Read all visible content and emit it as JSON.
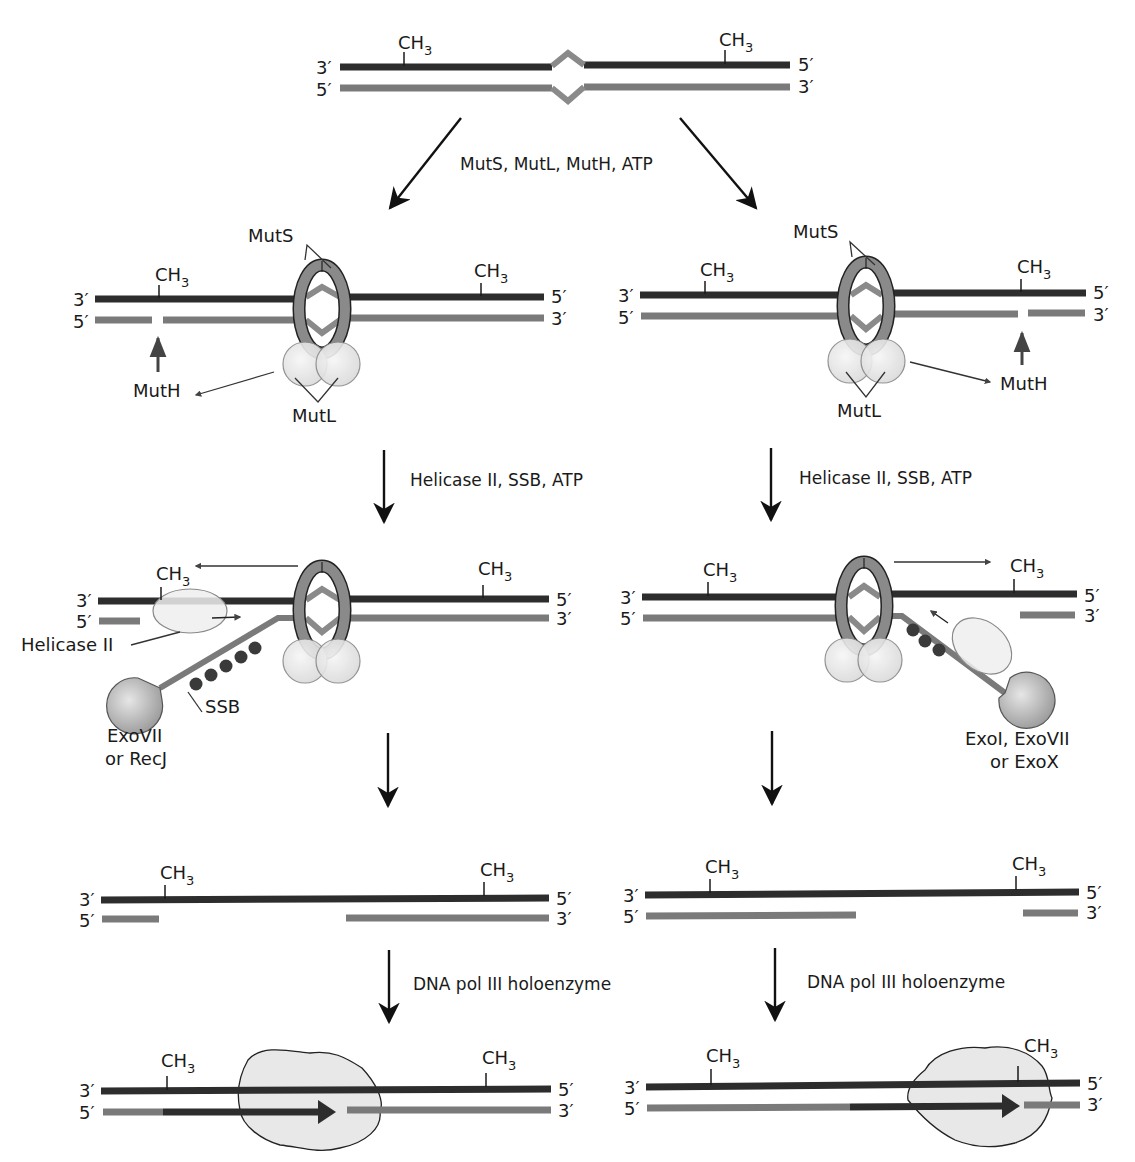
{
  "colors": {
    "parental_strand": "#2d2d2d",
    "daughter_strand": "#7a7a7a",
    "muts_ring": "#8a8a8a",
    "protein_fill": "#e8e8e8",
    "ssb": "#3a3a3a",
    "background": "#ffffff"
  },
  "ends": {
    "three": "3′",
    "five": "5′"
  },
  "methyl": {
    "c": "CH",
    "sub": "3"
  },
  "steps": {
    "step1": "MutS, MutL, MutH, ATP",
    "step2_left": "Helicase II, SSB, ATP",
    "step2_right": "Helicase II, SSB, ATP",
    "step4_left": "DNA pol III holoenzyme",
    "step4_right": "DNA pol III holoenzyme"
  },
  "labels": {
    "muts": "MutS",
    "mutl": "MutL",
    "muth": "MutH",
    "helicase": "Helicase II",
    "ssb": "SSB",
    "exo_left_1": "ExoVII",
    "exo_left_2": "or RecJ",
    "exo_right_1": "ExoI, ExoVII",
    "exo_right_2": "or ExoX"
  },
  "panels": [
    {
      "id": "mismatch",
      "description": "Duplex DNA with mismatch, both strands methylated"
    },
    {
      "id": "recognition_left",
      "description": "MutS/MutL bound; MutH nicks unmethylated strand 5′ of mismatch"
    },
    {
      "id": "recognition_right",
      "description": "MutS/MutL bound; MutH nicks unmethylated strand 3′ of mismatch"
    },
    {
      "id": "excision_left",
      "description": "Helicase II unwinds; SSB coats; ExoVII or RecJ degrades"
    },
    {
      "id": "excision_right",
      "description": "Helicase II unwinds; SSB coats; ExoI, ExoVII or ExoX degrades"
    },
    {
      "id": "gap_left",
      "description": "Gapped duplex"
    },
    {
      "id": "gap_right",
      "description": "Gapped duplex"
    },
    {
      "id": "resynthesis_left",
      "description": "DNA pol III fills gap"
    },
    {
      "id": "resynthesis_right",
      "description": "DNA pol III fills gap"
    }
  ]
}
